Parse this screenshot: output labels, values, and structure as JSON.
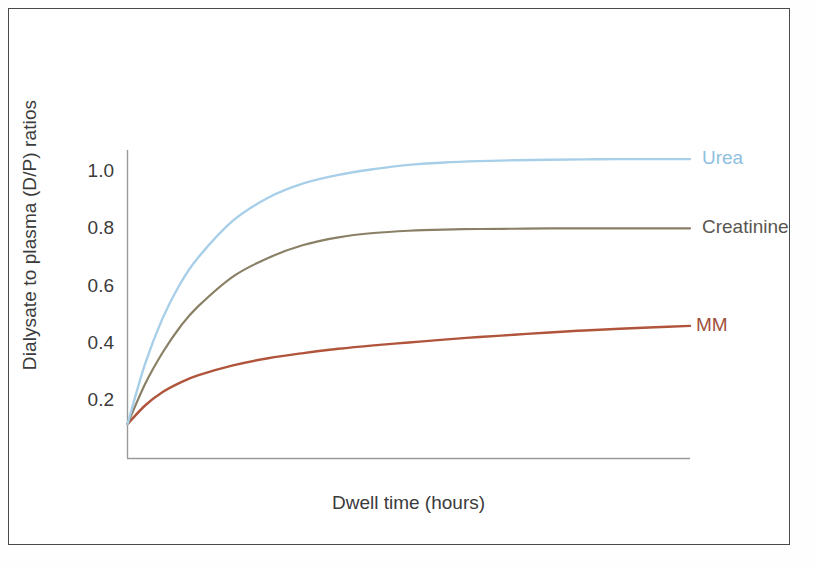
{
  "figure": {
    "background_color": "#ffffff",
    "frame_color": "#4a4a4a"
  },
  "chart_data": {
    "type": "line",
    "title": "",
    "subtitle": "",
    "xlabel": "Dwell time (hours)",
    "ylabel": "Dialysate to plasma (D/P) ratios",
    "xlim": [
      0,
      8
    ],
    "ylim": [
      0,
      1.12
    ],
    "grid": false,
    "legend_position": "right-inline-end-of-line",
    "x_tick_labels": [],
    "y_tick_labels": [
      "0.2",
      "0.4",
      "0.6",
      "0.8",
      "1.0"
    ],
    "y_ticks": [
      0.2,
      0.4,
      0.6,
      0.8,
      1.0
    ],
    "x": [
      0,
      0.25,
      0.5,
      0.75,
      1,
      1.5,
      2,
      2.5,
      3,
      3.5,
      4,
      4.5,
      5,
      5.5,
      6,
      6.5,
      7,
      7.5,
      8
    ],
    "series": [
      {
        "name": "Urea",
        "color": "#a8cfe8",
        "label_color": "#8fbfe0",
        "values": [
          0.12,
          0.33,
          0.49,
          0.61,
          0.7,
          0.83,
          0.91,
          0.96,
          0.99,
          1.01,
          1.025,
          1.033,
          1.038,
          1.041,
          1.043,
          1.044,
          1.045,
          1.045,
          1.045
        ]
      },
      {
        "name": "Creatinine",
        "color": "#8a8066",
        "label_color": "#5a5650",
        "values": [
          0.12,
          0.26,
          0.37,
          0.46,
          0.53,
          0.635,
          0.7,
          0.745,
          0.772,
          0.787,
          0.795,
          0.799,
          0.801,
          0.802,
          0.803,
          0.803,
          0.803,
          0.803,
          0.803
        ]
      },
      {
        "name": "MM",
        "color": "#b0543c",
        "label_color": "#a0503a",
        "values": [
          0.12,
          0.185,
          0.232,
          0.265,
          0.29,
          0.325,
          0.35,
          0.368,
          0.383,
          0.395,
          0.405,
          0.415,
          0.424,
          0.432,
          0.44,
          0.447,
          0.453,
          0.458,
          0.463
        ]
      }
    ],
    "series_end_labels": [
      {
        "name": "Urea",
        "x": 8,
        "y": 1.045
      },
      {
        "name": "Creatinine",
        "x": 8,
        "y": 0.803
      },
      {
        "name": "MM",
        "x": 8,
        "y": 0.463
      }
    ]
  }
}
